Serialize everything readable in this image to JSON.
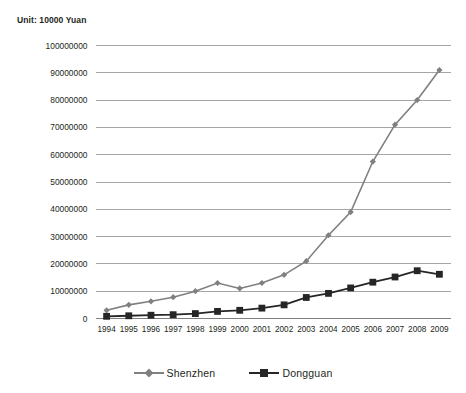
{
  "unit_note": "Unit: 10000 Yuan",
  "legend": {
    "position": "bottom",
    "entries": [
      {
        "label": "Shenzhen",
        "marker": "diamond-marker-icon",
        "color": "#808080"
      },
      {
        "label": "Dongguan",
        "marker": "square-marker-icon",
        "color": "#262626"
      }
    ]
  },
  "chart_data": {
    "type": "line",
    "title": "",
    "subtitle": "",
    "xlabel": "",
    "ylabel": "",
    "annotations": [
      "Unit: 10000 Yuan"
    ],
    "grid": true,
    "legend_position": "bottom",
    "categories": [
      "1994",
      "1995",
      "1996",
      "1997",
      "1998",
      "1999",
      "2000",
      "2001",
      "2002",
      "2003",
      "2004",
      "2005",
      "2006",
      "2007",
      "2008",
      "2009"
    ],
    "x": [
      1994,
      1995,
      1996,
      1997,
      1998,
      1999,
      2000,
      2001,
      2002,
      2003,
      2004,
      2005,
      2006,
      2007,
      2008,
      2009
    ],
    "ylim": [
      0,
      100000000
    ],
    "yticks": [
      0,
      10000000,
      20000000,
      30000000,
      40000000,
      50000000,
      60000000,
      70000000,
      80000000,
      90000000,
      100000000
    ],
    "ytick_labels": [
      "0",
      "10000000",
      "20000000",
      "30000000",
      "40000000",
      "50000000",
      "60000000",
      "70000000",
      "80000000",
      "90000000",
      "100000000"
    ],
    "series": [
      {
        "name": "Shenzhen",
        "color": "#808080",
        "marker": "diamond",
        "values": [
          3000000,
          5000000,
          6300000,
          7800000,
          10000000,
          13000000,
          11000000,
          13000000,
          16000000,
          21000000,
          30500000,
          39000000,
          57500000,
          71000000,
          80000000,
          91000000
        ]
      },
      {
        "name": "Dongguan",
        "color": "#262626",
        "marker": "square",
        "values": [
          800000,
          1000000,
          1200000,
          1400000,
          1800000,
          2600000,
          3000000,
          3800000,
          5000000,
          7700000,
          9200000,
          11200000,
          13300000,
          15200000,
          17500000,
          16200000
        ]
      }
    ],
    "note": "Shenzhen 2008 peak 91000000 then 90000000 in 2009; series plotted left-to-right across 16 year categories."
  }
}
